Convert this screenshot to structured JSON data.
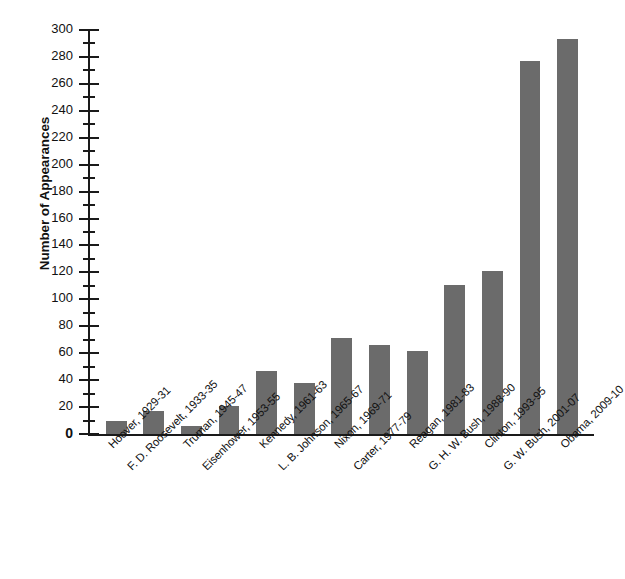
{
  "chart_data": {
    "type": "bar",
    "title": "",
    "subtitle": "",
    "xlabel": "",
    "ylabel": "Number of Appearances",
    "ylim": [
      0,
      300
    ],
    "ytick_step": 20,
    "yminor_step": 10,
    "grid": false,
    "legend": null,
    "bar_color": "#6b6b6b",
    "axis_color": "#1a1a1a",
    "categories": [
      "Hoover, 1929-31",
      "F. D. Roosevelt, 1933-35",
      "Truman, 1945-47",
      "Eisenhower, 1953-55",
      "Kennedy, 1961-63",
      "L. B. Johnson, 1965-67",
      "Nixon, 1969-71",
      "Carter, 1977-79",
      "Reagan, 1981-83",
      "G. H. W. Bush, 1988-90",
      "Clinton, 1993-95",
      "G. W. Bush, 2001-07",
      "Obama, 2009-10"
    ],
    "values": [
      10,
      17,
      6,
      21,
      47,
      38,
      71,
      66,
      62,
      111,
      121,
      277,
      293
    ],
    "ytick_labels": [
      "0",
      "20",
      "40",
      "60",
      "80",
      "100",
      "120",
      "140",
      "160",
      "180",
      "200",
      "220",
      "240",
      "260",
      "280",
      "300"
    ]
  }
}
